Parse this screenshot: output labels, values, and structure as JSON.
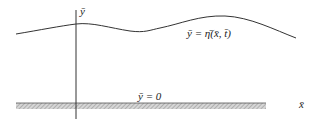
{
  "diagram": {
    "type": "free-surface wave over flat bottom",
    "labels": {
      "y_axis": "ȳ",
      "x_axis": "x̄",
      "surface": "ȳ = η̄(x̄, t̄)",
      "bottom": "ȳ = 0"
    },
    "colors": {
      "line": "#333333",
      "hatch": "#9a9a9a",
      "background": "#ffffff"
    }
  }
}
